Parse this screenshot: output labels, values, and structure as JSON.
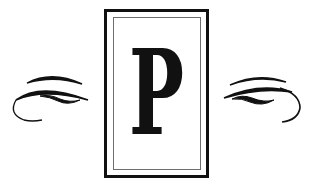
{
  "monogram": {
    "letter": "P"
  },
  "colors": {
    "ink": "#111111",
    "inner_frame": "#6e6e6e",
    "background": "#ffffff"
  },
  "ornaments": {
    "left": "swash-flourish-left",
    "right": "swash-flourish-right"
  }
}
